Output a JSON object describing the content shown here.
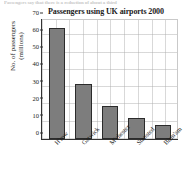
{
  "clipped_header_text": "Passengers  say  that  there  is  a  reduction  of  about  a  third",
  "chart_data": {
    "type": "bar",
    "title": "Passengers using UK airports 2000",
    "xlabel": "",
    "ylabel_line1": "No. of passengers",
    "ylabel_line2": "(millions)",
    "categories": [
      "H'row",
      "Gatwick",
      "M'chester",
      "Stansted",
      "Birm'am"
    ],
    "values": [
      65,
      32,
      19,
      12,
      8
    ],
    "series": [
      {
        "name": "No. of passengers (millions)",
        "values": [
          65,
          32,
          19,
          12,
          8
        ]
      }
    ],
    "ylim": [
      0,
      70
    ],
    "yticks": [
      0,
      10,
      20,
      30,
      40,
      50,
      60,
      70
    ],
    "ytick_labels": [
      "0",
      "10",
      "20",
      "30",
      "40",
      "50",
      "60",
      "70"
    ],
    "grid": true,
    "legend": false,
    "legend_position": "none",
    "bar_fill_color": "#7d7d7d",
    "bar_border_color": "#2b2b2b",
    "grid_color": "#aaaaaa",
    "axis_color": "#333333"
  }
}
